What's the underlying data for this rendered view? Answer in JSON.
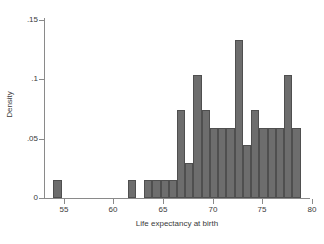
{
  "chart_data": {
    "type": "bar",
    "subtype": "histogram",
    "title": "",
    "xlabel": "Life expectancy at birth",
    "ylabel": "Density",
    "xlim": [
      53.0,
      79.8
    ],
    "ylim": [
      0,
      0.15
    ],
    "xticks": [
      "55",
      "60",
      "65",
      "70",
      "75",
      "80"
    ],
    "xtick_values": [
      55,
      60,
      65,
      70,
      75,
      80
    ],
    "yticks": [
      "0",
      ".05",
      ".1",
      ".15"
    ],
    "ytick_values": [
      0,
      0.05,
      0.1,
      0.15
    ],
    "grid": false,
    "legend": null,
    "bin_width": 0.83,
    "bar_color": "#6d6d6d",
    "bar_edge_color": "#4f4f4f",
    "axis_color": "#8a8a8a",
    "background": "#ffffff",
    "bins": [
      {
        "x0": 53.95,
        "x1": 54.78,
        "value": 0.0148
      },
      {
        "x0": 61.42,
        "x1": 62.25,
        "value": 0.0148
      },
      {
        "x0": 63.08,
        "x1": 63.91,
        "value": 0.0148
      },
      {
        "x0": 63.91,
        "x1": 64.74,
        "value": 0.0148
      },
      {
        "x0": 64.74,
        "x1": 65.57,
        "value": 0.0148
      },
      {
        "x0": 65.57,
        "x1": 66.4,
        "value": 0.0148
      },
      {
        "x0": 66.4,
        "x1": 67.23,
        "value": 0.0742
      },
      {
        "x0": 67.23,
        "x1": 68.06,
        "value": 0.0296
      },
      {
        "x0": 68.06,
        "x1": 68.89,
        "value": 0.1036
      },
      {
        "x0": 68.89,
        "x1": 69.72,
        "value": 0.0742
      },
      {
        "x0": 69.72,
        "x1": 70.55,
        "value": 0.0593
      },
      {
        "x0": 70.55,
        "x1": 71.38,
        "value": 0.0593
      },
      {
        "x0": 71.38,
        "x1": 72.21,
        "value": 0.0593
      },
      {
        "x0": 72.21,
        "x1": 73.04,
        "value": 0.1333
      },
      {
        "x0": 73.04,
        "x1": 73.87,
        "value": 0.0444
      },
      {
        "x0": 73.87,
        "x1": 74.7,
        "value": 0.0742
      },
      {
        "x0": 74.7,
        "x1": 75.53,
        "value": 0.0593
      },
      {
        "x0": 75.53,
        "x1": 76.36,
        "value": 0.0593
      },
      {
        "x0": 76.36,
        "x1": 77.19,
        "value": 0.0593
      },
      {
        "x0": 77.19,
        "x1": 78.02,
        "value": 0.1036
      },
      {
        "x0": 78.02,
        "x1": 78.85,
        "value": 0.0593
      }
    ]
  }
}
